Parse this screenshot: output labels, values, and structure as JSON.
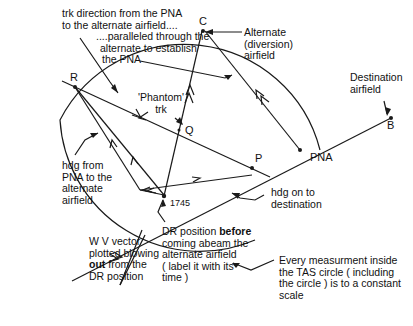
{
  "diagram": {
    "points": {
      "R": "R",
      "C": "C",
      "Q": "Q",
      "P": "P",
      "B": "B",
      "PNA": "PNA",
      "dr_time": "1745"
    },
    "labels": {
      "trk_direction": [
        "trk direction from the PNA",
        "to the alternate airfield...."
      ],
      "paralleled": [
        "....paralleled through the",
        "alternate to establish",
        "the PNA"
      ],
      "alternate": [
        "Alternate",
        "(diversion)",
        "airfield"
      ],
      "destination": [
        "Destination",
        "airfield"
      ],
      "phantom_trk": [
        "'Phantom'",
        "trk"
      ],
      "hdg_from_pna": [
        "hdg from",
        "PNA to the",
        "alternate",
        "airfield"
      ],
      "hdg_on": [
        "hdg on to",
        "destination"
      ],
      "wv_vector": [
        "W V vector",
        "plotted blowing",
        "out from the",
        "DR position"
      ],
      "wv_vector_bold_word": "out",
      "dr_position": [
        "DR position ",
        "before",
        "coming abeam the",
        "alternate airfield",
        "( label it with its",
        "time )"
      ],
      "constant_scale": [
        "Every measurment inside",
        "the TAS circle ( including",
        "the circle ) is to a constant",
        "scale"
      ]
    },
    "colors": {
      "line": "#1a1a1a",
      "background": "#ffffff"
    }
  }
}
